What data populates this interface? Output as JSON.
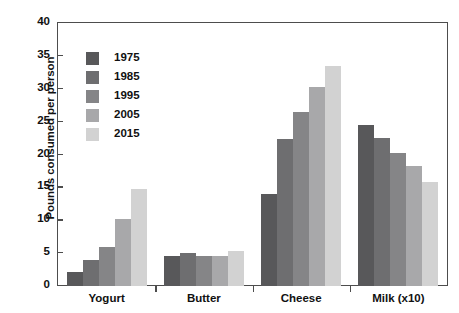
{
  "chart_data": {
    "type": "bar",
    "title": "",
    "xlabel": "",
    "ylabel": "Pounds consumed per person",
    "categories": [
      "Yogurt",
      "Butter",
      "Cheese",
      "Milk (x10)"
    ],
    "series": [
      {
        "name": "1975",
        "color": "#58585a",
        "values": [
          2.1,
          4.6,
          14.0,
          24.5
        ]
      },
      {
        "name": "1985",
        "color": "#6e6e70",
        "values": [
          3.9,
          5.0,
          22.3,
          22.5
        ]
      },
      {
        "name": "1995",
        "color": "#858587",
        "values": [
          6.0,
          4.5,
          26.4,
          20.3
        ]
      },
      {
        "name": "2005",
        "color": "#a8a8aa",
        "values": [
          10.2,
          4.5,
          30.2,
          18.3
        ]
      },
      {
        "name": "2015",
        "color": "#d2d2d2",
        "values": [
          14.8,
          5.4,
          33.5,
          15.8
        ]
      }
    ],
    "ylim": [
      0,
      40
    ],
    "yticks": [
      0,
      5,
      10,
      15,
      20,
      25,
      30,
      35,
      40
    ],
    "grid": false,
    "legend_position": "upper-left-inside"
  },
  "axis": {
    "y_title": "Pounds consumed per person"
  }
}
